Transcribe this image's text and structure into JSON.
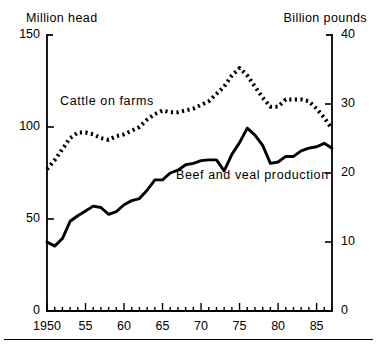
{
  "units": {
    "left": "Million head",
    "right": "Billion pounds"
  },
  "labels": {
    "cattle": "Cattle on farms",
    "beef": "Beef and veal production"
  },
  "axis": {
    "left_ticks": [
      "150",
      "100",
      "50",
      "0"
    ],
    "right_ticks": [
      "40",
      "30",
      "20",
      "10",
      "0"
    ],
    "x_ticks": [
      "1950",
      "55",
      "60",
      "65",
      "70",
      "75",
      "80",
      "85"
    ]
  },
  "colors": {
    "ink": "#000000",
    "background": "#ffffff"
  },
  "chart_data": {
    "type": "line",
    "title": "",
    "xlabel": "",
    "ylabel": "Million head",
    "y2label": "Billion pounds",
    "grid": false,
    "legend": "inline-annotations",
    "xlim": [
      1950,
      1987
    ],
    "ylim": [
      0,
      150
    ],
    "y2lim": [
      0,
      40
    ],
    "x": [
      1950,
      1951,
      1952,
      1953,
      1954,
      1955,
      1956,
      1957,
      1958,
      1959,
      1960,
      1961,
      1962,
      1963,
      1964,
      1965,
      1966,
      1967,
      1968,
      1969,
      1970,
      1971,
      1972,
      1973,
      1974,
      1975,
      1976,
      1977,
      1978,
      1979,
      1980,
      1981,
      1982,
      1983,
      1984,
      1985,
      1986,
      1987
    ],
    "series": [
      {
        "name": "Cattle on farms",
        "axis": "left",
        "unit": "Million head",
        "style": "dotted",
        "values": [
          77,
          82,
          88,
          94,
          97,
          97,
          96,
          94,
          93,
          95,
          96,
          98,
          100,
          104,
          107,
          109,
          108,
          108,
          109,
          110,
          112,
          114,
          118,
          122,
          128,
          132,
          128,
          122,
          116,
          111,
          111,
          115,
          115,
          115,
          114,
          110,
          105,
          99
        ]
      },
      {
        "name": "Beef and veal production",
        "axis": "right",
        "unit": "Billion pounds",
        "style": "solid",
        "values": [
          10.0,
          9.4,
          10.5,
          13.0,
          13.8,
          14.5,
          15.2,
          15.0,
          14.0,
          14.4,
          15.4,
          16.0,
          16.3,
          17.5,
          19.0,
          19.0,
          20.0,
          20.4,
          21.2,
          21.4,
          21.8,
          21.9,
          21.9,
          20.3,
          22.7,
          24.4,
          26.5,
          25.5,
          24.0,
          21.4,
          21.6,
          22.4,
          22.4,
          23.2,
          23.6,
          23.8,
          24.3,
          23.6
        ]
      }
    ]
  }
}
